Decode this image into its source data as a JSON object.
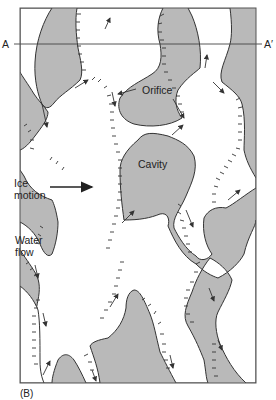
{
  "figure": {
    "panel_label": "(B)",
    "section_line": {
      "left_label": "A",
      "right_label": "A′"
    },
    "labels": {
      "orifice": "Orifice",
      "cavity": "Cavity",
      "ice_motion_line1": "Ice",
      "ice_motion_line2": "motion",
      "water_flow_line1": "Water",
      "water_flow_line2": "flow"
    },
    "colors": {
      "ice": "#b9b9b9",
      "cavity": "#ffffff",
      "outline": "#333333",
      "frame": "#555555"
    },
    "legend_semantics": {
      "gray_regions": "ice in contact with bed",
      "white_regions": "water-filled cavities",
      "hachured_edges": "cavity roof steps (lee-side)",
      "small_arrows": "water flow direction",
      "large_arrow": "ice motion direction"
    }
  }
}
